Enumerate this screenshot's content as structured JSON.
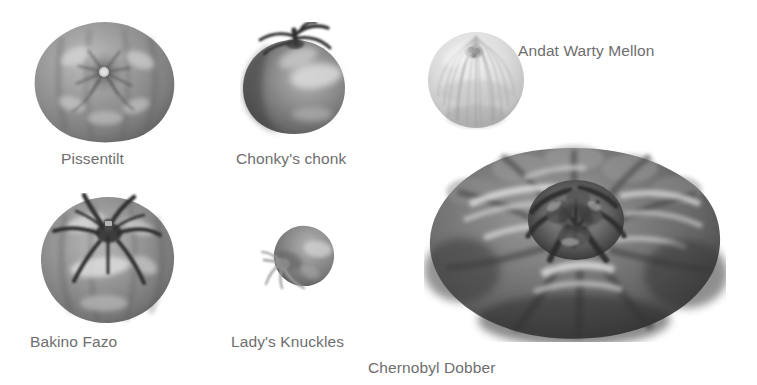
{
  "page": {
    "background_color": "#ffffff",
    "label_color": "#6e6e6e",
    "kind": "tomato-variety-comparison-plate",
    "width": 757,
    "height": 385
  },
  "specimens": [
    {
      "id": "pissentilt",
      "label": "Pissentilt",
      "shape": "round-ribbed-flattened",
      "tone": "mid-gray",
      "body_color": "#8d8d8d",
      "shadow_color": "#5d5d5d",
      "highlight_color": "#c8c8c8",
      "box": {
        "x": 32,
        "y": 20,
        "w": 146,
        "h": 124
      },
      "label_pos": {
        "x": 61,
        "y": 151
      }
    },
    {
      "id": "chonkys-chonk",
      "label": "Chonky's chonk",
      "shape": "round-glossy-with-stem",
      "tone": "dark-gray",
      "body_color": "#7a7a7a",
      "shadow_color": "#4a4a4a",
      "highlight_color": "#d2d2d2",
      "box": {
        "x": 240,
        "y": 22,
        "w": 108,
        "h": 116
      },
      "label_pos": {
        "x": 236,
        "y": 151
      }
    },
    {
      "id": "andat-warty-mellon",
      "label": "Andat Warty Mellon",
      "shape": "round-ribbed-pale-melon",
      "tone": "light-gray",
      "body_color": "#d6d6d6",
      "shadow_color": "#a8a8a8",
      "highlight_color": "#f0f0f0",
      "box": {
        "x": 426,
        "y": 30,
        "w": 100,
        "h": 100
      },
      "label_pos": {
        "x": 518,
        "y": 43
      }
    },
    {
      "id": "bakino-fazo",
      "label": "Bakino Fazo",
      "shape": "round-with-large-star-calyx",
      "tone": "mid-gray",
      "body_color": "#8a8a8a",
      "shadow_color": "#585858",
      "highlight_color": "#cfcfcf",
      "box": {
        "x": 38,
        "y": 193,
        "w": 140,
        "h": 134
      },
      "label_pos": {
        "x": 30,
        "y": 334
      }
    },
    {
      "id": "ladys-knuckles",
      "label": "Lady's Knuckles",
      "shape": "small-tilted-plum",
      "tone": "mid-gray",
      "body_color": "#8f8f8f",
      "shadow_color": "#5e5e5e",
      "highlight_color": "#c6c6c6",
      "box": {
        "x": 258,
        "y": 222,
        "w": 86,
        "h": 78
      },
      "label_pos": {
        "x": 231,
        "y": 334
      }
    },
    {
      "id": "chernobyl-dobber",
      "label": "Chernobyl Dobber",
      "shape": "giant-beefsteak-lobed",
      "tone": "dark-gray",
      "body_color": "#6f6f6f",
      "shadow_color": "#3c3c3c",
      "highlight_color": "#cacaca",
      "box": {
        "x": 424,
        "y": 142,
        "w": 302,
        "h": 200
      },
      "label_pos": {
        "x": 368,
        "y": 360
      }
    }
  ]
}
